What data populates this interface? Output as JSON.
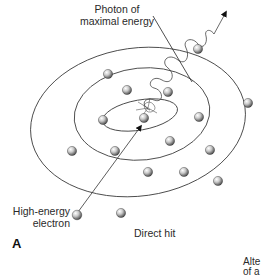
{
  "figure": {
    "panel_label": "A",
    "caption": "Direct hit",
    "labels": {
      "photon_line1": "Photon of",
      "photon_line2": "maximal energy",
      "electron_line1": "High-energy",
      "electron_line2": "electron"
    },
    "cropped_text": {
      "line1": "Alte",
      "line2": "of a"
    }
  },
  "atom": {
    "shells": [
      {
        "name": "outer",
        "cx": 138,
        "cy": 120,
        "rx": 108,
        "ry": 74,
        "rotate": -8
      },
      {
        "name": "middle",
        "cx": 142,
        "cy": 112,
        "rx": 68,
        "ry": 46,
        "rotate": -5
      },
      {
        "name": "inner",
        "cx": 136,
        "cy": 118,
        "rx": 35,
        "ry": 14,
        "rotate": -8
      }
    ],
    "electron_count_visible": 18
  }
}
